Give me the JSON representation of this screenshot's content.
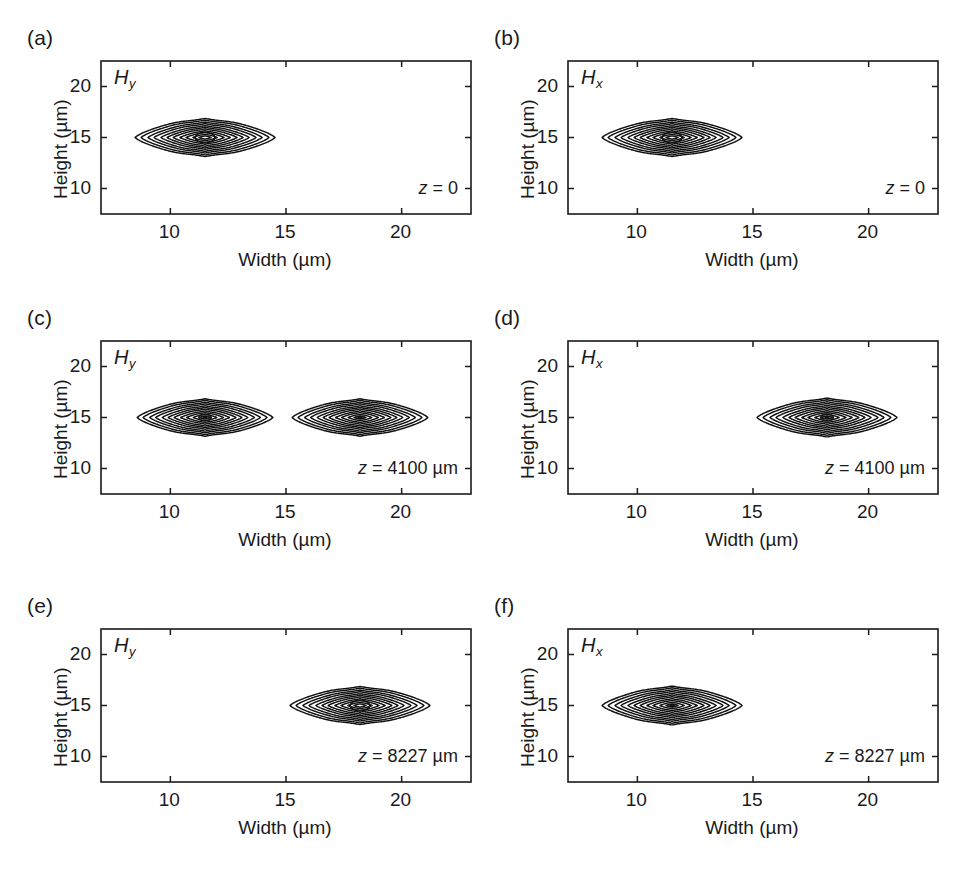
{
  "figure": {
    "kind": "contour-plot-grid",
    "rows": 3,
    "cols": 2,
    "background": "#ffffff",
    "line_color": "#111111"
  },
  "axis_common": {
    "xlabel": "Width (µm)",
    "ylabel": "Height (µm)",
    "xticks": [
      10,
      15,
      20
    ],
    "xtick_labels": [
      "10",
      "15",
      "20"
    ],
    "yticks": [
      10,
      15,
      20
    ],
    "ytick_labels": [
      "10",
      "15",
      "20"
    ],
    "xlim": [
      7.0,
      23.0
    ],
    "ylim": [
      7.5,
      22.5
    ],
    "grid": false
  },
  "panels": [
    {
      "letter": "(a)",
      "field": "H",
      "field_sub": "y",
      "z_var": "z",
      "z_eq": " = 0",
      "z_text": "z = 0",
      "lobes": [
        {
          "cx": 11.5,
          "cy": 15.0,
          "rx": 3.25,
          "ry": 2.9,
          "core": "ellipse"
        }
      ]
    },
    {
      "letter": "(b)",
      "field": "H",
      "field_sub": "x",
      "z_var": "z",
      "z_eq": " = 0",
      "z_text": "z = 0",
      "lobes": [
        {
          "cx": 11.5,
          "cy": 15.0,
          "rx": 3.25,
          "ry": 2.9,
          "core": "ellipse"
        }
      ]
    },
    {
      "letter": "(c)",
      "field": "H",
      "field_sub": "y",
      "z_var": "z",
      "z_eq": " = 4100 µm",
      "z_text": "z = 4100 µm",
      "lobes": [
        {
          "cx": 11.5,
          "cy": 15.0,
          "rx": 3.15,
          "ry": 2.85,
          "core": "small-ellipse"
        },
        {
          "cx": 18.2,
          "cy": 15.0,
          "rx": 3.15,
          "ry": 2.85,
          "core": "dot"
        }
      ]
    },
    {
      "letter": "(d)",
      "field": "H",
      "field_sub": "x",
      "z_var": "z",
      "z_eq": " = 4100 µm",
      "z_text": "z = 4100 µm",
      "lobes": [
        {
          "cx": 18.2,
          "cy": 15.0,
          "rx": 3.25,
          "ry": 2.95,
          "core": "small-ellipse"
        }
      ]
    },
    {
      "letter": "(e)",
      "field": "H",
      "field_sub": "y",
      "z_var": "z",
      "z_eq": " = 8227 µm",
      "z_text": "z = 8227 µm",
      "lobes": [
        {
          "cx": 18.2,
          "cy": 15.0,
          "rx": 3.25,
          "ry": 2.9,
          "core": "ellipse"
        }
      ]
    },
    {
      "letter": "(f)",
      "field": "H",
      "field_sub": "x",
      "z_var": "z",
      "z_eq": " = 8227 µm",
      "z_text": "z = 8227 µm",
      "lobes": [
        {
          "cx": 11.5,
          "cy": 15.0,
          "rx": 3.25,
          "ry": 2.95,
          "core": "dot"
        }
      ]
    }
  ],
  "chart_data": {
    "type": "contour",
    "title": "",
    "xlabel": "Width (µm)",
    "ylabel": "Height (µm)",
    "xlim": [
      7.0,
      23.0
    ],
    "ylim": [
      7.5,
      22.5
    ],
    "xticks": [
      10,
      15,
      20
    ],
    "yticks": [
      10,
      15,
      20
    ],
    "grid": false,
    "n_levels": 11,
    "level_fractions": [
      0.08,
      0.16,
      0.25,
      0.33,
      0.42,
      0.5,
      0.58,
      0.67,
      0.75,
      0.84,
      0.92
    ],
    "subplots": [
      {
        "id": "a",
        "field": "Hy",
        "z": 0,
        "z_unit": "",
        "peak_centers_um": [
          [
            11.5,
            15.0
          ]
        ]
      },
      {
        "id": "b",
        "field": "Hx",
        "z": 0,
        "z_unit": "",
        "peak_centers_um": [
          [
            11.5,
            15.0
          ]
        ]
      },
      {
        "id": "c",
        "field": "Hy",
        "z": 4100,
        "z_unit": "µm",
        "peak_centers_um": [
          [
            11.5,
            15.0
          ],
          [
            18.2,
            15.0
          ]
        ]
      },
      {
        "id": "d",
        "field": "Hx",
        "z": 4100,
        "z_unit": "µm",
        "peak_centers_um": [
          [
            18.2,
            15.0
          ]
        ]
      },
      {
        "id": "e",
        "field": "Hy",
        "z": 8227,
        "z_unit": "µm",
        "peak_centers_um": [
          [
            18.2,
            15.0
          ]
        ]
      },
      {
        "id": "f",
        "field": "Hx",
        "z": 8227,
        "z_unit": "µm",
        "peak_centers_um": [
          [
            11.5,
            15.0
          ]
        ]
      }
    ]
  }
}
